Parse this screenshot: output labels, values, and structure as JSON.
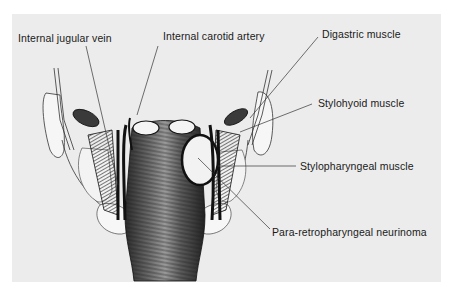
{
  "figure": {
    "background_color": "#ececec",
    "border_color": "#ffffff",
    "labels": [
      {
        "id": "internal-jugular-vein",
        "text": "Internal jugular vein"
      },
      {
        "id": "internal-carotid-artery",
        "text": "Internal carotid artery"
      },
      {
        "id": "digastric-muscle",
        "text": "Digastric muscle"
      },
      {
        "id": "stylohyoid-muscle",
        "text": "Stylohyoid muscle"
      },
      {
        "id": "stylopharyngeal-muscle",
        "text": "Stylopharyngeal muscle"
      },
      {
        "id": "para-retropharyngeal-neurinoma",
        "text": "Para-retropharyngeal neurinoma"
      }
    ]
  }
}
